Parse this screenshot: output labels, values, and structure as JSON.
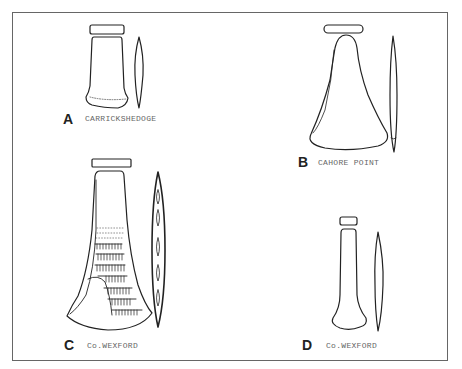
{
  "figure": {
    "panels": [
      {
        "letter": "A",
        "site": "CARRICKSHEDOGE"
      },
      {
        "letter": "B",
        "site": "CAHORE POINT"
      },
      {
        "letter": "C",
        "site": "Co.WEXFORD"
      },
      {
        "letter": "D",
        "site": "Co.WEXFORD"
      }
    ],
    "colors": {
      "ink": "#222222",
      "frame": "#666666",
      "label": "#666666",
      "background": "#ffffff"
    }
  }
}
